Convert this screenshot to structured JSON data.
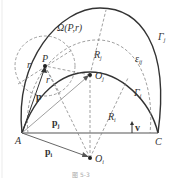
{
  "diagram": {
    "colors": {
      "solid": "#333333",
      "dashed": "#888888",
      "text": "#333333",
      "background": "#ffffff"
    },
    "points": {
      "A": {
        "label": "A",
        "x": 22,
        "y": 133
      },
      "C": {
        "label": "C",
        "x": 158,
        "y": 133
      },
      "P": {
        "label": "P",
        "x": 45,
        "y": 66
      },
      "Oj": {
        "label": "O",
        "sub": "j",
        "x": 90,
        "y": 75
      },
      "Oi": {
        "label": "O",
        "sub": "i",
        "x": 90,
        "y": 158
      }
    },
    "curves": {
      "outer_arc": {
        "label": "Γ",
        "sub": "j"
      },
      "inner_arc": {
        "label": "Γ",
        "sub": "i"
      },
      "epsilon_arc": {
        "label": "ε",
        "sub": "ij"
      },
      "omega_circle": {
        "label": "Ω(P,r)"
      }
    },
    "labels": {
      "r_upper": "r",
      "r_lower": "r",
      "Rj": {
        "label": "R",
        "sub": "j"
      },
      "Ri": {
        "label": "R",
        "sub": "i"
      },
      "p": "p",
      "pj": {
        "label": "p",
        "sub": "j"
      },
      "pi": {
        "label": "p",
        "sub": "i"
      },
      "v": "v"
    },
    "caption": "图 5-3"
  }
}
